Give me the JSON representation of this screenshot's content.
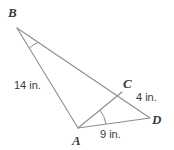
{
  "figure": {
    "background_color": "#ffffff",
    "line_color": "#8e8e8e",
    "text_color": "#3a3a3a",
    "width": 174,
    "height": 150,
    "vertices": [
      {
        "id": "B",
        "label": "B",
        "x": 17,
        "y": 28,
        "label_x": 8,
        "label_y": 17
      },
      {
        "id": "A",
        "label": "A",
        "x": 78,
        "y": 128,
        "label_x": 72,
        "label_y": 145
      },
      {
        "id": "C",
        "label": "C",
        "x": 122,
        "y": 92,
        "label_x": 123,
        "label_y": 88
      },
      {
        "id": "D",
        "label": "D",
        "x": 150,
        "y": 118,
        "label_x": 152,
        "label_y": 124
      }
    ],
    "segments": [
      {
        "id": "BA",
        "from": "B",
        "to": "A"
      },
      {
        "id": "BD",
        "from": "B",
        "to": "D"
      },
      {
        "id": "AC",
        "from": "A",
        "to": "C"
      },
      {
        "id": "AD",
        "from": "A",
        "to": "D"
      }
    ],
    "measures": [
      {
        "id": "BA-length",
        "text": "14 in.",
        "x": 14,
        "y": 89,
        "segment": "BA"
      },
      {
        "id": "CD-length",
        "text": "4 in.",
        "x": 136,
        "y": 101,
        "segment": "CD"
      },
      {
        "id": "AD-length",
        "text": "9 in.",
        "x": 100,
        "y": 138,
        "segment": "AD"
      }
    ],
    "angle_marks": [
      {
        "id": "angle-B",
        "vertex": "B",
        "between": [
          "BA",
          "BC"
        ]
      },
      {
        "id": "angle-A",
        "vertex": "A",
        "between": [
          "AC",
          "AD"
        ]
      }
    ]
  }
}
